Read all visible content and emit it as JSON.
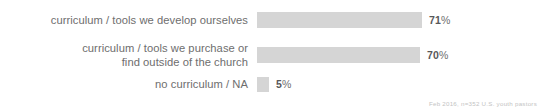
{
  "chart_data": {
    "type": "bar",
    "orientation": "horizontal",
    "title": "",
    "subtitle": "",
    "xlabel": "",
    "ylabel": "",
    "grid": false,
    "legend": null,
    "xlim": [
      0,
      100
    ],
    "categories": [
      "curriculum / tools we develop ourselves",
      "curriculum / tools we purchase or\nfind outside of the church",
      "no curriculum / NA"
    ],
    "values": [
      71,
      70,
      5
    ],
    "value_labels": [
      "71",
      "70",
      "5"
    ],
    "value_suffix": "%",
    "bar_color": "#d5d5d5",
    "label_color": "#6e6e6e",
    "value_color": "#58585a",
    "background": "#ffffff",
    "annotations": [
      "Feb 2016, n=352 U.S. youth pastors"
    ]
  },
  "footnote": {
    "text": "Feb 2016, n=352 U.S. youth pastors",
    "color": "#c3c3c3"
  }
}
